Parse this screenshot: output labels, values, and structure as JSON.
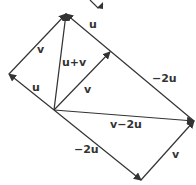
{
  "diagram": {
    "points": {
      "origin": [
        54,
        110
      ],
      "left": [
        9,
        74
      ],
      "top": [
        66,
        14
      ],
      "mid": [
        110,
        52
      ],
      "right": [
        194,
        121
      ],
      "bottom": [
        141,
        180
      ]
    },
    "labels": {
      "v_left": "v",
      "u_left": "u",
      "u_plus_v": "u+v",
      "v_mid": "v",
      "u_top": "u",
      "neg2u_top": "−2u",
      "v_minus_2u": "v−2u",
      "neg2u_bottom": "−2u",
      "v_bottom": "v"
    },
    "colors": {
      "line": "#333333",
      "text": "#333333"
    }
  }
}
